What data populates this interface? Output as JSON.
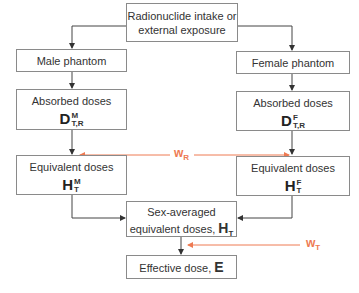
{
  "diagram": {
    "title_box": {
      "line1": "Radionuclide intake or",
      "line2": "external exposure"
    },
    "male_phantom": {
      "label": "Male phantom"
    },
    "female_phantom": {
      "label": "Female phantom"
    },
    "absorbed_male": {
      "label": "Absorbed doses",
      "symbol": "D",
      "sup": "M",
      "sub": "T,R"
    },
    "absorbed_female": {
      "label": "Absorbed doses",
      "symbol": "D",
      "sup": "F",
      "sub": "T,R"
    },
    "equivalent_male": {
      "label": "Equivalent doses",
      "symbol": "H",
      "sup": "M",
      "sub": "T"
    },
    "equivalent_female": {
      "label": "Equivalent doses",
      "symbol": "H",
      "sup": "F",
      "sub": "T"
    },
    "sex_averaged": {
      "line1": "Sex-averaged",
      "line2": "equivalent doses,",
      "symbol": "H",
      "sub": "T"
    },
    "effective": {
      "label": "Effective dose,",
      "symbol": "E"
    },
    "weighting_radiation": {
      "symbol": "w",
      "sub": "R"
    },
    "weighting_tissue": {
      "symbol": "w",
      "sub": "T"
    },
    "colors": {
      "accent": "#ee7a52",
      "border": "#8a8a8a",
      "line": "#444444"
    }
  }
}
